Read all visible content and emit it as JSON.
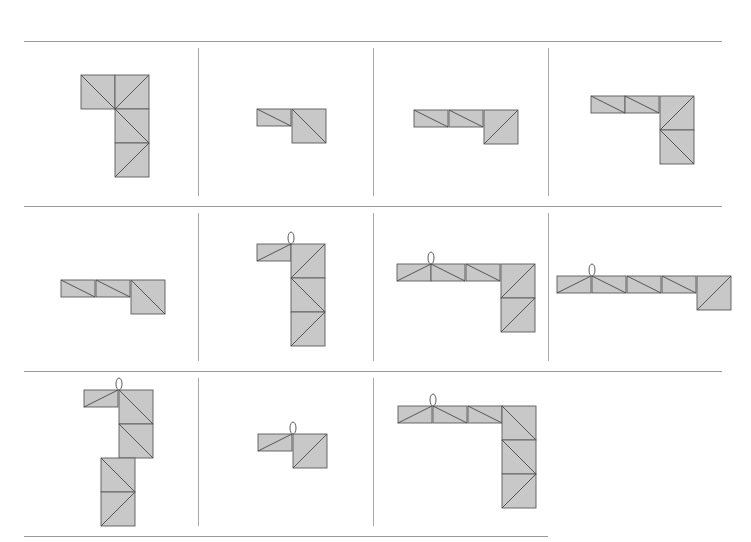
{
  "figure": {
    "square_size": 34,
    "colors": {
      "fill": "#c8c8c8",
      "stroke": "#5a5a5a",
      "grid_line": "#9a9a9a"
    },
    "grid": {
      "rows": 3,
      "cols": 4,
      "hlines": [
        {
          "y": 41,
          "x1": 24,
          "x2": 722
        },
        {
          "y": 206,
          "x1": 24,
          "x2": 722
        },
        {
          "y": 371,
          "x1": 24,
          "x2": 722
        },
        {
          "y": 536,
          "x1": 24,
          "x2": 548
        }
      ],
      "vlines": [
        {
          "x": 198,
          "y1": 48,
          "y2": 196
        },
        {
          "x": 373,
          "y1": 48,
          "y2": 196
        },
        {
          "x": 548,
          "y1": 48,
          "y2": 196
        },
        {
          "x": 198,
          "y1": 213,
          "y2": 361
        },
        {
          "x": 373,
          "y1": 213,
          "y2": 361
        },
        {
          "x": 548,
          "y1": 213,
          "y2": 361
        },
        {
          "x": 198,
          "y1": 378,
          "y2": 526
        },
        {
          "x": 373,
          "y1": 378,
          "y2": 526
        }
      ]
    },
    "cells": [
      {
        "id": "r1c1",
        "squares": [
          {
            "x": 81,
            "y": 75,
            "d": "tl-br"
          },
          {
            "x": 115,
            "y": 75,
            "d": "tr-bl"
          },
          {
            "x": 115,
            "y": 109,
            "d": "tl-br"
          },
          {
            "x": 115,
            "y": 143,
            "d": "tr-bl"
          }
        ]
      },
      {
        "id": "r1c2",
        "squares": [
          {
            "x": 257,
            "y": 109,
            "h": 17,
            "d": "tl-br"
          },
          {
            "x": 292,
            "y": 109,
            "d": "tl-br"
          }
        ]
      },
      {
        "id": "r1c3",
        "squares": [
          {
            "x": 414,
            "y": 110,
            "h": 17,
            "d": "tl-br"
          },
          {
            "x": 449,
            "y": 110,
            "h": 17,
            "d": "tl-br"
          },
          {
            "x": 484,
            "y": 110,
            "d": "tr-bl"
          }
        ]
      },
      {
        "id": "r1c4",
        "squares": [
          {
            "x": 591,
            "y": 96,
            "h": 17,
            "d": "tl-br"
          },
          {
            "x": 625,
            "y": 96,
            "h": 17,
            "d": "tl-br"
          },
          {
            "x": 660,
            "y": 96,
            "d": "tr-bl"
          },
          {
            "x": 660,
            "y": 130,
            "d": "tl-br"
          }
        ]
      },
      {
        "id": "r2c1",
        "squares": [
          {
            "x": 61,
            "y": 280,
            "h": 17,
            "d": "tl-br"
          },
          {
            "x": 96,
            "y": 280,
            "h": 17,
            "d": "tl-br"
          },
          {
            "x": 131,
            "y": 280,
            "d": "tl-br"
          }
        ]
      },
      {
        "id": "r2c2",
        "hook": {
          "x": 291,
          "y": 238
        },
        "squares": [
          {
            "x": 257,
            "y": 244,
            "h": 17,
            "d": "bl-tr"
          },
          {
            "x": 291,
            "y": 244,
            "d": "tr-bl"
          },
          {
            "x": 291,
            "y": 278,
            "d": "tl-br"
          },
          {
            "x": 291,
            "y": 312,
            "d": "tr-bl"
          }
        ]
      },
      {
        "id": "r2c3",
        "hook": {
          "x": 431,
          "y": 258
        },
        "squares": [
          {
            "x": 397,
            "y": 264,
            "h": 17,
            "d": "bl-tr"
          },
          {
            "x": 431,
            "y": 264,
            "h": 17,
            "d": "tl-br"
          },
          {
            "x": 466,
            "y": 264,
            "h": 17,
            "d": "tl-br"
          },
          {
            "x": 501,
            "y": 264,
            "d": "tr-bl"
          },
          {
            "x": 501,
            "y": 298,
            "d": "tr-bl"
          }
        ]
      },
      {
        "id": "r2c4",
        "hook": {
          "x": 592,
          "y": 270
        },
        "squares": [
          {
            "x": 557,
            "y": 276,
            "h": 17,
            "d": "bl-tr"
          },
          {
            "x": 592,
            "y": 276,
            "h": 17,
            "d": "tl-br"
          },
          {
            "x": 627,
            "y": 276,
            "h": 17,
            "d": "tl-br"
          },
          {
            "x": 662,
            "y": 276,
            "h": 17,
            "d": "tl-br"
          },
          {
            "x": 697,
            "y": 276,
            "d": "tr-bl"
          }
        ]
      },
      {
        "id": "r3c1",
        "hook": {
          "x": 119,
          "y": 384
        },
        "squares": [
          {
            "x": 84,
            "y": 390,
            "h": 17,
            "d": "bl-tr"
          },
          {
            "x": 119,
            "y": 390,
            "d": "tl-br"
          },
          {
            "x": 119,
            "y": 424,
            "d": "tl-br"
          },
          {
            "x": 101,
            "y": 458,
            "d": "tl-br"
          },
          {
            "x": 101,
            "y": 492,
            "d": "tr-bl"
          }
        ]
      },
      {
        "id": "r3c2",
        "hook": {
          "x": 293,
          "y": 428
        },
        "squares": [
          {
            "x": 258,
            "y": 434,
            "h": 17,
            "d": "bl-tr"
          },
          {
            "x": 293,
            "y": 434,
            "d": "tr-bl"
          }
        ]
      },
      {
        "id": "r3c3",
        "hook": {
          "x": 433,
          "y": 400
        },
        "squares": [
          {
            "x": 398,
            "y": 406,
            "h": 17,
            "d": "bl-tr"
          },
          {
            "x": 433,
            "y": 406,
            "h": 17,
            "d": "tl-br"
          },
          {
            "x": 468,
            "y": 406,
            "h": 17,
            "d": "tl-br"
          },
          {
            "x": 502,
            "y": 406,
            "d": "tl-br"
          },
          {
            "x": 502,
            "y": 440,
            "d": "tl-br"
          },
          {
            "x": 502,
            "y": 474,
            "d": "tr-bl"
          }
        ]
      }
    ]
  }
}
